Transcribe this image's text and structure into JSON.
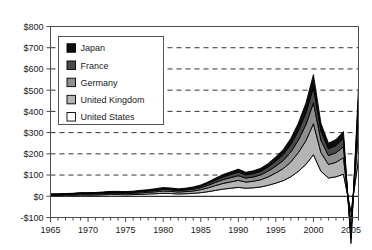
{
  "chart_data": {
    "type": "area",
    "stacked": true,
    "title": "",
    "subtitle": "",
    "xlabel": "",
    "ylabel": "",
    "xlim": [
      1965,
      2006
    ],
    "ylim": [
      -100,
      800
    ],
    "ytick_step": 100,
    "xtick_step": 5,
    "xtick_minor_step": 1,
    "grid": true,
    "grid_axis": "y",
    "legend_position": "upper-left-inside",
    "y_tick_labels": [
      "$800",
      "$700",
      "$600",
      "$500",
      "$400",
      "$300",
      "$200",
      "$100",
      "$0",
      "-$100"
    ],
    "y_tick_values": [
      800,
      700,
      600,
      500,
      400,
      300,
      200,
      100,
      0,
      -100
    ],
    "x_tick_labels": [
      "1965",
      "1970",
      "1975",
      "1980",
      "1985",
      "1990",
      "1995",
      "2000",
      "2005"
    ],
    "x_tick_values": [
      1965,
      1970,
      1975,
      1980,
      1985,
      1990,
      1995,
      2000,
      2005
    ],
    "x": [
      1965,
      1966,
      1967,
      1968,
      1969,
      1970,
      1971,
      1972,
      1973,
      1974,
      1975,
      1976,
      1977,
      1978,
      1979,
      1980,
      1981,
      1982,
      1983,
      1984,
      1985,
      1986,
      1987,
      1988,
      1989,
      1990,
      1991,
      1992,
      1993,
      1994,
      1995,
      1996,
      1997,
      1998,
      1999,
      2000,
      2001,
      2002,
      2003,
      2004,
      2005,
      2006
    ],
    "series": [
      {
        "name": "United States",
        "color": "#ffffff",
        "order": 1,
        "values": [
          4,
          4,
          5,
          5,
          6,
          6,
          6,
          7,
          8,
          8,
          7,
          8,
          9,
          11,
          12,
          14,
          13,
          11,
          12,
          14,
          17,
          22,
          28,
          34,
          38,
          42,
          38,
          40,
          44,
          52,
          62,
          74,
          92,
          118,
          150,
          196,
          118,
          86,
          92,
          104,
          -76,
          176
        ]
      },
      {
        "name": "United Kingdom",
        "color": "#b5b5b5",
        "order": 2,
        "values": [
          3,
          3,
          3,
          4,
          4,
          4,
          5,
          5,
          6,
          6,
          6,
          6,
          7,
          8,
          9,
          11,
          10,
          9,
          10,
          11,
          14,
          18,
          23,
          27,
          30,
          33,
          29,
          31,
          34,
          40,
          48,
          57,
          70,
          88,
          112,
          146,
          88,
          64,
          68,
          78,
          -56,
          132
        ]
      },
      {
        "name": "Germany",
        "color": "#8e8e8e",
        "order": 3,
        "values": [
          2,
          2,
          2,
          2,
          3,
          3,
          3,
          3,
          4,
          4,
          4,
          4,
          5,
          5,
          6,
          7,
          7,
          6,
          7,
          8,
          9,
          12,
          15,
          18,
          20,
          22,
          19,
          20,
          23,
          27,
          32,
          38,
          47,
          59,
          75,
          98,
          58,
          42,
          45,
          52,
          -38,
          88
        ]
      },
      {
        "name": "France",
        "color": "#4a4a4a",
        "order": 4,
        "values": [
          1,
          1,
          2,
          2,
          2,
          2,
          2,
          3,
          3,
          3,
          3,
          3,
          4,
          4,
          5,
          5,
          5,
          5,
          5,
          6,
          7,
          9,
          11,
          13,
          15,
          17,
          15,
          16,
          17,
          20,
          24,
          29,
          35,
          44,
          56,
          73,
          44,
          32,
          34,
          39,
          -29,
          66
        ]
      },
      {
        "name": "Japan",
        "color": "#0d0d0d",
        "order": 5,
        "values": [
          1,
          1,
          1,
          1,
          2,
          2,
          2,
          2,
          2,
          2,
          2,
          3,
          3,
          3,
          4,
          4,
          4,
          4,
          4,
          5,
          6,
          7,
          9,
          11,
          12,
          14,
          12,
          13,
          14,
          16,
          20,
          23,
          29,
          36,
          46,
          60,
          36,
          26,
          28,
          32,
          -24,
          54
        ]
      }
    ]
  },
  "legend": {
    "items": [
      {
        "label": "Japan",
        "swatch": "#0d0d0d"
      },
      {
        "label": "France",
        "swatch": "#4a4a4a"
      },
      {
        "label": "Germany",
        "swatch": "#8e8e8e"
      },
      {
        "label": "United Kingdom",
        "swatch": "#b5b5b5"
      },
      {
        "label": "United States",
        "swatch": "#ffffff"
      }
    ]
  }
}
